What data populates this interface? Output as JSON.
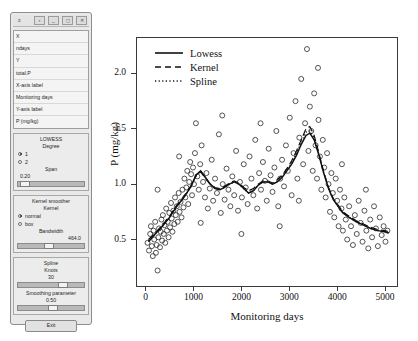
{
  "panel": {
    "titlebar_icons": [
      "menu-icon",
      "back-icon",
      "minimize-icon",
      "restore-icon",
      "close-icon"
    ],
    "variable_list": [
      {
        "label": "X"
      },
      {
        "label": "ndays"
      },
      {
        "label": "Y"
      },
      {
        "label": "total.P"
      },
      {
        "label": "X-axis label"
      },
      {
        "label": "Monitoring days"
      },
      {
        "label": "Y-axis label"
      },
      {
        "label": "P (mg/kg)"
      }
    ],
    "lowess": {
      "title": "LOWESS",
      "degree_label": "Degree",
      "degree_options": [
        {
          "label": "1",
          "selected": true
        },
        {
          "label": "2",
          "selected": false
        }
      ],
      "span_label": "Span",
      "span_value": "0.20"
    },
    "kernel": {
      "title": "Kernel smoother",
      "kernel_label": "Kernel",
      "kernel_options": [
        {
          "label": "normal",
          "selected": true
        },
        {
          "label": "box",
          "selected": false
        }
      ],
      "bandwidth_label": "Bandwidth",
      "bandwidth_value": "464.0"
    },
    "spline": {
      "title": "Spline",
      "knots_label": "Knots",
      "knots_value": "30",
      "smoothing_label": "Smoothing parameter",
      "smoothing_value": "0.50"
    },
    "exit_label": "Exit"
  },
  "chart_data": {
    "type": "scatter",
    "title": "",
    "xlabel": "Monitoring days",
    "ylabel": "P (mg/kg)",
    "xlim": [
      -180,
      5250
    ],
    "ylim": [
      0.08,
      2.32
    ],
    "xticks": [
      0,
      1000,
      2000,
      3000,
      4000,
      5000
    ],
    "yticks": [
      0.5,
      1.0,
      1.5,
      2.0
    ],
    "ytick_labels": [
      "0.5",
      "1.0",
      "1.5",
      "2.0"
    ],
    "xtick_labels": [
      "0",
      "1000",
      "2000",
      "3000",
      "4000",
      "5000"
    ],
    "grid": false,
    "legend_position": "top-left",
    "marker": "open-circle",
    "legend": [
      {
        "name": "Lowess",
        "style": "solid"
      },
      {
        "name": "Kernel",
        "style": "dashed"
      },
      {
        "name": "Spline",
        "style": "dotted"
      }
    ],
    "points": [
      [
        40,
        0.47
      ],
      [
        70,
        0.4
      ],
      [
        95,
        0.55
      ],
      [
        110,
        0.62
      ],
      [
        130,
        0.44
      ],
      [
        150,
        0.35
      ],
      [
        165,
        0.58
      ],
      [
        180,
        0.5
      ],
      [
        200,
        0.66
      ],
      [
        215,
        0.38
      ],
      [
        230,
        0.45
      ],
      [
        250,
        0.22
      ],
      [
        265,
        0.52
      ],
      [
        280,
        0.6
      ],
      [
        300,
        0.43
      ],
      [
        315,
        0.57
      ],
      [
        330,
        0.68
      ],
      [
        345,
        0.49
      ],
      [
        360,
        0.72
      ],
      [
        380,
        0.55
      ],
      [
        395,
        0.63
      ],
      [
        410,
        0.47
      ],
      [
        430,
        0.78
      ],
      [
        445,
        0.58
      ],
      [
        460,
        0.66
      ],
      [
        480,
        0.52
      ],
      [
        495,
        0.74
      ],
      [
        510,
        0.61
      ],
      [
        530,
        0.83
      ],
      [
        545,
        0.69
      ],
      [
        560,
        0.57
      ],
      [
        580,
        0.76
      ],
      [
        600,
        0.64
      ],
      [
        615,
        0.88
      ],
      [
        630,
        0.72
      ],
      [
        650,
        0.8
      ],
      [
        670,
        0.66
      ],
      [
        690,
        0.92
      ],
      [
        710,
        0.75
      ],
      [
        730,
        0.84
      ],
      [
        750,
        0.7
      ],
      [
        770,
        0.95
      ],
      [
        790,
        0.79
      ],
      [
        810,
        1.05
      ],
      [
        830,
        0.88
      ],
      [
        850,
        0.97
      ],
      [
        870,
        1.12
      ],
      [
        890,
        0.82
      ],
      [
        910,
        1.02
      ],
      [
        930,
        1.2
      ],
      [
        950,
        1.09
      ],
      [
        970,
        0.9
      ],
      [
        990,
        1.15
      ],
      [
        1010,
        1.0
      ],
      [
        1030,
        1.28
      ],
      [
        1050,
        1.55
      ],
      [
        1080,
        1.07
      ],
      [
        1110,
        0.95
      ],
      [
        1140,
        1.18
      ],
      [
        1170,
        1.35
      ],
      [
        1200,
        1.02
      ],
      [
        1240,
        0.88
      ],
      [
        1270,
        1.1
      ],
      [
        1300,
        0.78
      ],
      [
        1340,
        0.96
      ],
      [
        1380,
        1.22
      ],
      [
        1410,
        0.85
      ],
      [
        1450,
        1.05
      ],
      [
        1490,
        0.92
      ],
      [
        1530,
        1.45
      ],
      [
        1570,
        0.74
      ],
      [
        1610,
        1.0
      ],
      [
        1650,
        0.86
      ],
      [
        1690,
        1.14
      ],
      [
        1730,
        0.95
      ],
      [
        1770,
        0.8
      ],
      [
        1810,
        1.07
      ],
      [
        1850,
        0.9
      ],
      [
        1890,
        1.3
      ],
      [
        1930,
        0.76
      ],
      [
        1970,
        1.02
      ],
      [
        2010,
        0.88
      ],
      [
        2050,
        1.18
      ],
      [
        2090,
        0.97
      ],
      [
        2130,
        0.82
      ],
      [
        2170,
        1.25
      ],
      [
        2210,
        1.05
      ],
      [
        2250,
        0.9
      ],
      [
        2290,
        1.4
      ],
      [
        2330,
        0.78
      ],
      [
        2370,
        1.1
      ],
      [
        2410,
        0.95
      ],
      [
        2450,
        1.2
      ],
      [
        2490,
        1.03
      ],
      [
        2530,
        0.85
      ],
      [
        2570,
        1.32
      ],
      [
        2610,
        1.08
      ],
      [
        2650,
        0.93
      ],
      [
        2690,
        1.15
      ],
      [
        2730,
        1.48
      ],
      [
        2770,
        0.8
      ],
      [
        2810,
        1.05
      ],
      [
        2850,
        1.22
      ],
      [
        2890,
        0.98
      ],
      [
        2930,
        1.35
      ],
      [
        2970,
        1.12
      ],
      [
        3010,
        1.6
      ],
      [
        3050,
        0.9
      ],
      [
        3090,
        1.28
      ],
      [
        3130,
        1.75
      ],
      [
        3170,
        1.05
      ],
      [
        3210,
        1.42
      ],
      [
        3250,
        1.95
      ],
      [
        3290,
        1.18
      ],
      [
        3330,
        1.55
      ],
      [
        3370,
        2.22
      ],
      [
        3400,
        1.3
      ],
      [
        3430,
        1.7
      ],
      [
        3460,
        1.48
      ],
      [
        3490,
        1.12
      ],
      [
        3520,
        1.82
      ],
      [
        3550,
        1.35
      ],
      [
        3580,
        1.05
      ],
      [
        3610,
        1.58
      ],
      [
        3640,
        1.25
      ],
      [
        3670,
        0.95
      ],
      [
        3700,
        1.4
      ],
      [
        3730,
        1.15
      ],
      [
        3760,
        0.88
      ],
      [
        3790,
        1.28
      ],
      [
        3820,
        1.0
      ],
      [
        3850,
        0.75
      ],
      [
        3880,
        1.1
      ],
      [
        3910,
        0.92
      ],
      [
        3940,
        0.7
      ],
      [
        3970,
        1.05
      ],
      [
        4000,
        0.85
      ],
      [
        4030,
        0.62
      ],
      [
        4060,
        0.95
      ],
      [
        4090,
        0.78
      ],
      [
        4120,
        0.58
      ],
      [
        4150,
        0.88
      ],
      [
        4180,
        0.68
      ],
      [
        4210,
        0.5
      ],
      [
        4250,
        0.8
      ],
      [
        4290,
        0.62
      ],
      [
        4330,
        0.45
      ],
      [
        4370,
        0.72
      ],
      [
        4410,
        0.55
      ],
      [
        4450,
        0.85
      ],
      [
        4490,
        0.65
      ],
      [
        4530,
        0.48
      ],
      [
        4570,
        0.76
      ],
      [
        4610,
        0.58
      ],
      [
        4650,
        0.42
      ],
      [
        4690,
        0.68
      ],
      [
        4730,
        0.52
      ],
      [
        4770,
        0.8
      ],
      [
        4810,
        0.6
      ],
      [
        4850,
        0.44
      ],
      [
        4890,
        0.7
      ],
      [
        4930,
        0.54
      ],
      [
        4970,
        0.62
      ],
      [
        5010,
        0.48
      ],
      [
        5050,
        0.58
      ],
      [
        250,
        0.95
      ],
      [
        700,
        1.25
      ],
      [
        1150,
        0.65
      ],
      [
        1600,
        1.62
      ],
      [
        2000,
        0.55
      ],
      [
        2400,
        1.55
      ],
      [
        2800,
        0.62
      ],
      [
        3200,
        0.85
      ],
      [
        3600,
        2.05
      ],
      [
        4100,
        1.18
      ],
      [
        4600,
        0.95
      ]
    ],
    "series": [
      {
        "name": "Lowess",
        "style": "solid",
        "points": [
          [
            60,
            0.48
          ],
          [
            200,
            0.55
          ],
          [
            350,
            0.62
          ],
          [
            500,
            0.7
          ],
          [
            650,
            0.8
          ],
          [
            800,
            0.88
          ],
          [
            950,
            0.98
          ],
          [
            1050,
            1.08
          ],
          [
            1150,
            1.12
          ],
          [
            1250,
            1.06
          ],
          [
            1350,
            1.0
          ],
          [
            1450,
            0.96
          ],
          [
            1550,
            0.95
          ],
          [
            1650,
            0.97
          ],
          [
            1750,
            1.0
          ],
          [
            1850,
            1.02
          ],
          [
            1950,
            1.0
          ],
          [
            2050,
            0.96
          ],
          [
            2150,
            0.92
          ],
          [
            2250,
            0.94
          ],
          [
            2350,
            0.99
          ],
          [
            2450,
            1.02
          ],
          [
            2550,
            1.02
          ],
          [
            2650,
            1.0
          ],
          [
            2750,
            1.02
          ],
          [
            2850,
            1.06
          ],
          [
            2950,
            1.12
          ],
          [
            3050,
            1.18
          ],
          [
            3150,
            1.26
          ],
          [
            3250,
            1.36
          ],
          [
            3350,
            1.44
          ],
          [
            3430,
            1.46
          ],
          [
            3520,
            1.4
          ],
          [
            3620,
            1.26
          ],
          [
            3720,
            1.1
          ],
          [
            3820,
            0.96
          ],
          [
            3920,
            0.86
          ],
          [
            4020,
            0.8
          ],
          [
            4120,
            0.74
          ],
          [
            4250,
            0.7
          ],
          [
            4400,
            0.66
          ],
          [
            4550,
            0.63
          ],
          [
            4700,
            0.6
          ],
          [
            4850,
            0.58
          ],
          [
            5000,
            0.57
          ],
          [
            5080,
            0.56
          ]
        ]
      },
      {
        "name": "Kernel",
        "style": "dashed",
        "points": [
          [
            60,
            0.5
          ],
          [
            200,
            0.56
          ],
          [
            350,
            0.63
          ],
          [
            500,
            0.71
          ],
          [
            650,
            0.81
          ],
          [
            800,
            0.89
          ],
          [
            950,
            0.99
          ],
          [
            1050,
            1.07
          ],
          [
            1150,
            1.11
          ],
          [
            1250,
            1.05
          ],
          [
            1350,
            1.0
          ],
          [
            1450,
            0.97
          ],
          [
            1550,
            0.96
          ],
          [
            1650,
            0.98
          ],
          [
            1750,
            1.01
          ],
          [
            1850,
            1.03
          ],
          [
            1950,
            1.01
          ],
          [
            2050,
            0.97
          ],
          [
            2150,
            0.94
          ],
          [
            2250,
            0.96
          ],
          [
            2350,
            1.0
          ],
          [
            2450,
            1.03
          ],
          [
            2550,
            1.03
          ],
          [
            2650,
            1.01
          ],
          [
            2750,
            1.04
          ],
          [
            2850,
            1.08
          ],
          [
            2950,
            1.14
          ],
          [
            3050,
            1.21
          ],
          [
            3150,
            1.3
          ],
          [
            3250,
            1.4
          ],
          [
            3350,
            1.5
          ],
          [
            3430,
            1.52
          ],
          [
            3520,
            1.44
          ],
          [
            3620,
            1.28
          ],
          [
            3720,
            1.11
          ],
          [
            3820,
            0.97
          ],
          [
            3920,
            0.87
          ],
          [
            4020,
            0.81
          ],
          [
            4120,
            0.75
          ],
          [
            4250,
            0.71
          ],
          [
            4400,
            0.67
          ],
          [
            4550,
            0.64
          ],
          [
            4700,
            0.61
          ],
          [
            4850,
            0.59
          ],
          [
            5000,
            0.58
          ],
          [
            5080,
            0.57
          ]
        ]
      },
      {
        "name": "Spline",
        "style": "dotted",
        "points": [
          [
            60,
            0.49
          ],
          [
            200,
            0.55
          ],
          [
            350,
            0.62
          ],
          [
            500,
            0.7
          ],
          [
            650,
            0.8
          ],
          [
            800,
            0.88
          ],
          [
            950,
            0.98
          ],
          [
            1050,
            1.08
          ],
          [
            1150,
            1.12
          ],
          [
            1250,
            1.06
          ],
          [
            1350,
            1.0
          ],
          [
            1450,
            0.96
          ],
          [
            1550,
            0.95
          ],
          [
            1650,
            0.97
          ],
          [
            1750,
            1.0
          ],
          [
            1850,
            1.02
          ],
          [
            1950,
            1.0
          ],
          [
            2050,
            0.96
          ],
          [
            2150,
            0.92
          ],
          [
            2250,
            0.94
          ],
          [
            2350,
            0.99
          ],
          [
            2450,
            1.02
          ],
          [
            2550,
            1.02
          ],
          [
            2650,
            1.0
          ],
          [
            2750,
            1.03
          ],
          [
            2850,
            1.07
          ],
          [
            2950,
            1.13
          ],
          [
            3050,
            1.19
          ],
          [
            3150,
            1.28
          ],
          [
            3250,
            1.38
          ],
          [
            3350,
            1.47
          ],
          [
            3430,
            1.48
          ],
          [
            3520,
            1.42
          ],
          [
            3620,
            1.27
          ],
          [
            3720,
            1.1
          ],
          [
            3820,
            0.96
          ],
          [
            3920,
            0.86
          ],
          [
            4020,
            0.8
          ],
          [
            4120,
            0.74
          ],
          [
            4250,
            0.7
          ],
          [
            4400,
            0.66
          ],
          [
            4550,
            0.63
          ],
          [
            4700,
            0.6
          ],
          [
            4850,
            0.58
          ],
          [
            5000,
            0.57
          ],
          [
            5080,
            0.56
          ]
        ]
      }
    ]
  }
}
